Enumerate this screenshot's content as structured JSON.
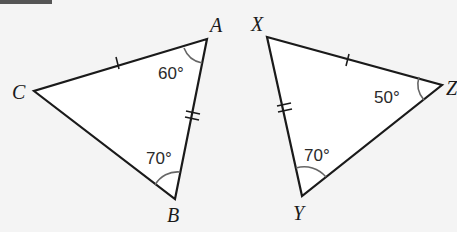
{
  "figure": {
    "triangle_left": {
      "vertices": {
        "A": "A",
        "B": "B",
        "C": "C"
      },
      "angles": {
        "A": "60°",
        "B": "70°"
      },
      "ticks": {
        "CA": 1,
        "AB": 2
      }
    },
    "triangle_right": {
      "vertices": {
        "X": "X",
        "Y": "Y",
        "Z": "Z"
      },
      "angles": {
        "Z": "50°",
        "Y": "70°"
      },
      "ticks": {
        "XZ": 1,
        "XY": 2
      }
    },
    "colors": {
      "stroke": "#1a1a1a",
      "background": "#f4f4f4",
      "fill": "#ffffff",
      "arc": "#666666"
    }
  }
}
